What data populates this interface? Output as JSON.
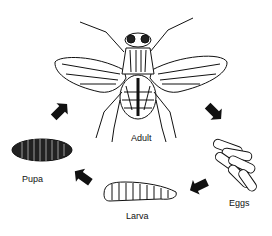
{
  "diagram": {
    "type": "life-cycle",
    "stages": [
      {
        "id": "adult",
        "label": "Adult"
      },
      {
        "id": "eggs",
        "label": "Eggs"
      },
      {
        "id": "larva",
        "label": "Larva"
      },
      {
        "id": "pupa",
        "label": "Pupa"
      }
    ],
    "flow": [
      "adult",
      "eggs",
      "larva",
      "pupa",
      "adult"
    ],
    "colors": {
      "ink": "#111111",
      "background": "#ffffff"
    }
  }
}
